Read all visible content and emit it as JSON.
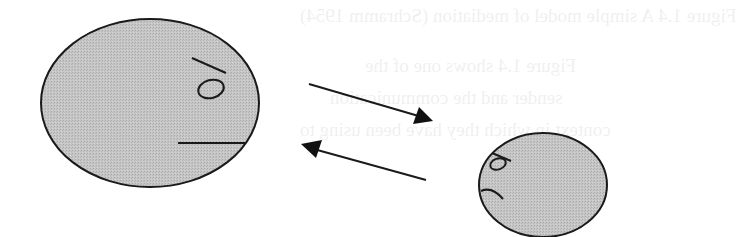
{
  "figure": {
    "fill_color": "#c4c4c4",
    "stroke_color": "#1a1a1a",
    "background_color": "#ffffff",
    "large_face": {
      "label": "Large face",
      "expression": "neutral"
    },
    "small_face": {
      "label": "Small face",
      "expression": "frowning"
    },
    "arrows": [
      {
        "label": "Arrow from large face to small face",
        "direction": "right-down"
      },
      {
        "label": "Arrow from small face to large face",
        "direction": "left-up"
      }
    ]
  },
  "bleed_through_text": {
    "line1": "Figure 1.4 A simple model of mediation (Schramm 1954)",
    "line2": "Figure 1.4 shows one of the",
    "line3": "sender and the communication",
    "line4": "context in which they have been using to"
  }
}
